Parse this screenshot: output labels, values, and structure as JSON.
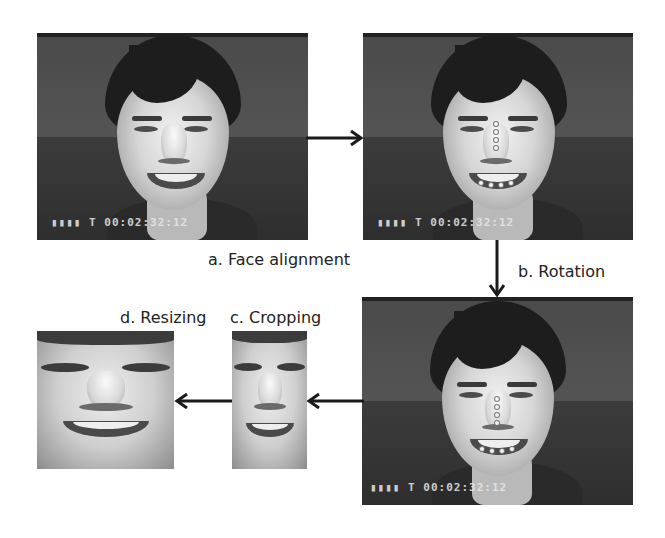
{
  "figure": {
    "steps": [
      {
        "id": "a",
        "label": "a. Face alignment"
      },
      {
        "id": "b",
        "label": "b. Rotation"
      },
      {
        "id": "c",
        "label": "c. Cropping"
      },
      {
        "id": "d",
        "label": "d. Resizing"
      }
    ],
    "frames": {
      "original": {
        "timecode": "▮▮▮▮ T 00:02:32:12"
      },
      "aligned": {
        "timecode": "▮▮▮▮ T 00:02:32:12"
      },
      "rotated": {
        "timecode": "▮▮▮▮ T 00:02:32:12"
      }
    },
    "colors": {
      "arrow": "#1a1a1a",
      "label_text": "#222222",
      "background": "#ffffff",
      "landmark": "#f4f4f4"
    }
  }
}
